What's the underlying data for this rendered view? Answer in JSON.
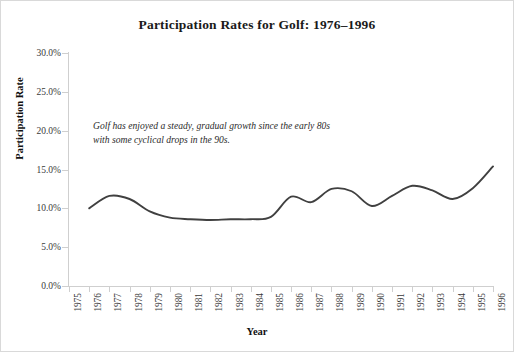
{
  "chart_data": {
    "type": "line",
    "title": "Participation Rates for Golf: 1976–1996",
    "xlabel": "Year",
    "ylabel": "Participation Rate",
    "grid": false,
    "legend": "none",
    "xlim": [
      1975,
      1996
    ],
    "ylim": [
      0,
      30
    ],
    "ytick_labels": [
      "0.0%",
      "5.0%",
      "10.0%",
      "15.0%",
      "20.0%",
      "25.0%",
      "30.0%"
    ],
    "ytick_values": [
      0,
      5,
      10,
      15,
      20,
      25,
      30
    ],
    "xtick_labels": [
      "1975",
      "1976",
      "1977",
      "1978",
      "1979",
      "1980",
      "1981",
      "1982",
      "1983",
      "1984",
      "1985",
      "1986",
      "1987",
      "1988",
      "1989",
      "1990",
      "1991",
      "1992",
      "1993",
      "1994",
      "1995",
      "1996"
    ],
    "annotations": [
      "Golf has enjoyed a steady, gradual growth since the early 80s with some cyclical drops in the 90s."
    ],
    "series": [
      {
        "name": "Golf participation rate",
        "color": "#404040",
        "x": [
          1976,
          1977,
          1978,
          1979,
          1980,
          1981,
          1982,
          1983,
          1984,
          1985,
          1986,
          1987,
          1988,
          1989,
          1990,
          1991,
          1992,
          1993,
          1994,
          1995,
          1996
        ],
        "values": [
          10.0,
          11.6,
          11.2,
          9.6,
          8.8,
          8.6,
          8.5,
          8.6,
          8.6,
          8.9,
          11.5,
          10.8,
          12.5,
          12.2,
          10.3,
          11.6,
          12.9,
          12.3,
          11.2,
          12.6,
          15.4
        ]
      }
    ]
  },
  "axis": {
    "y_title": "Participation Rate",
    "x_title": "Year"
  }
}
